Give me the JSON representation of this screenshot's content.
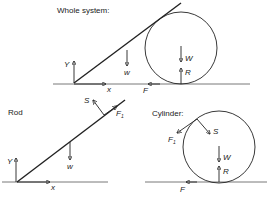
{
  "panels": {
    "whole_system": {
      "title": "Whole system:",
      "labels": {
        "y": "Y",
        "x": "x",
        "w": "w",
        "W": "W",
        "R": "R",
        "F": "F"
      }
    },
    "rod": {
      "title": "Rod",
      "labels": {
        "y": "Y",
        "x": "x",
        "w": "w",
        "S": "S",
        "F1": "F",
        "F1_sub": "1"
      }
    },
    "cylinder": {
      "title": "Cylinder:",
      "labels": {
        "S": "S",
        "F1": "F",
        "F1_sub": "1",
        "W": "W",
        "R": "R",
        "F": "F"
      }
    }
  },
  "colors": {
    "ink": "#222222",
    "ground": "#555555",
    "background": "#ffffff"
  }
}
